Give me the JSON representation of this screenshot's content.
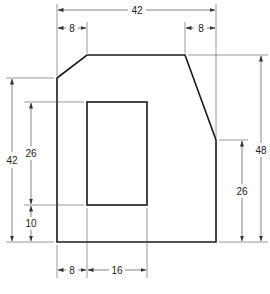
{
  "drawing": {
    "type": "technical-dimension-drawing",
    "outline_color": "#1a1a1a",
    "dimension_color": "#333333"
  },
  "dimensions": {
    "overall_width": "42",
    "left_chamfer_width": "8",
    "right_chamfer_width": "8",
    "left_height": "42",
    "hole_height": "26",
    "hole_bottom_offset": "10",
    "overall_height": "48",
    "right_vertical_height": "26",
    "hole_left_offset": "8",
    "hole_width": "16"
  }
}
